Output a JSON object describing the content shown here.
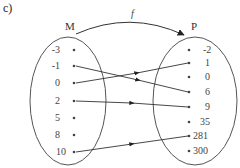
{
  "part_label": "c)",
  "function_label": "f",
  "sets": {
    "domain": {
      "name": "M",
      "elements": [
        "-3",
        "-1",
        "0",
        "2",
        "5",
        "8",
        "10"
      ]
    },
    "codomain": {
      "name": "P",
      "elements": [
        "-2",
        "1",
        "0",
        "6",
        "9",
        "35",
        "281",
        "300"
      ]
    }
  },
  "mappings": [
    {
      "from": "-1",
      "to": "6"
    },
    {
      "from": "0",
      "to": "1"
    },
    {
      "from": "2",
      "to": "9"
    },
    {
      "from": "10",
      "to": "281"
    }
  ],
  "colors": {
    "stroke": "#555555",
    "arrow": "#222222",
    "text": "#444444"
  }
}
